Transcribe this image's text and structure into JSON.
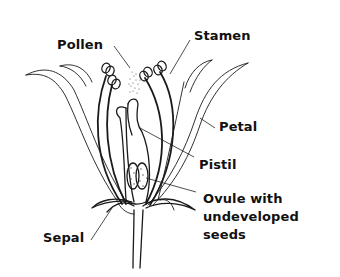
{
  "diagram": {
    "labels": {
      "pollen": "Pollen",
      "stamen": "Stamen",
      "petal": "Petal",
      "pistil": "Pistil",
      "ovule_line1": "Ovule with",
      "ovule_line2": "undeveloped",
      "ovule_line3": "seeds",
      "sepal": "Sepal"
    },
    "colors": {
      "ink": "#1a1a1a",
      "background": "#ffffff"
    }
  }
}
